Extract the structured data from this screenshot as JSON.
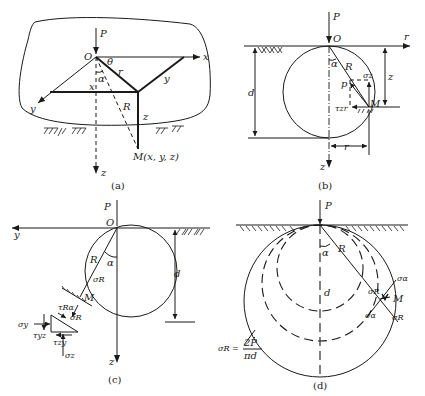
{
  "figure": {
    "panels": [
      {
        "id": "a",
        "caption": "(a)",
        "labels": {
          "load": "P",
          "origin": "O",
          "x_axis": "x",
          "y_axis": "y",
          "z_axis": "z",
          "theta": "θ",
          "alpha": "α",
          "r": "r",
          "R": "R",
          "x_proj": "x",
          "y_proj": "y",
          "z_proj": "z",
          "point": "M(x, y, z)"
        }
      },
      {
        "id": "b",
        "caption": "(b)",
        "labels": {
          "load": "P",
          "origin": "O",
          "r_axis": "r",
          "z_axis": "z",
          "alpha": "α",
          "R": "R",
          "p": "p",
          "sigma_z": "σz",
          "tau_zr": "τzr",
          "point": "M",
          "d": "d",
          "z_dim": "z",
          "r_dim": "r"
        }
      },
      {
        "id": "c",
        "caption": "(c)",
        "labels": {
          "load": "P",
          "origin": "O",
          "y_axis": "y",
          "z_axis": "z",
          "R": "R",
          "alpha": "α",
          "sigma_R": "σR",
          "point": "M",
          "d": "d",
          "tau_Ra": "τRα",
          "sigma_R2": "σR",
          "sigma_y": "σy",
          "tau_yz": "τyz",
          "tau_zy": "τzy",
          "sigma_z": "σz"
        }
      },
      {
        "id": "d",
        "caption": "(d)",
        "labels": {
          "load": "P",
          "alpha": "α",
          "R": "R",
          "d": "d",
          "sigma_R_inner": "σR",
          "sigma_a_top": "σα",
          "sigma_a_bottom": "σα",
          "sigma_R_out": "σR",
          "point": "M",
          "formula_lhs": "σR =",
          "formula_num": "2P",
          "formula_den": "πd"
        }
      }
    ]
  }
}
